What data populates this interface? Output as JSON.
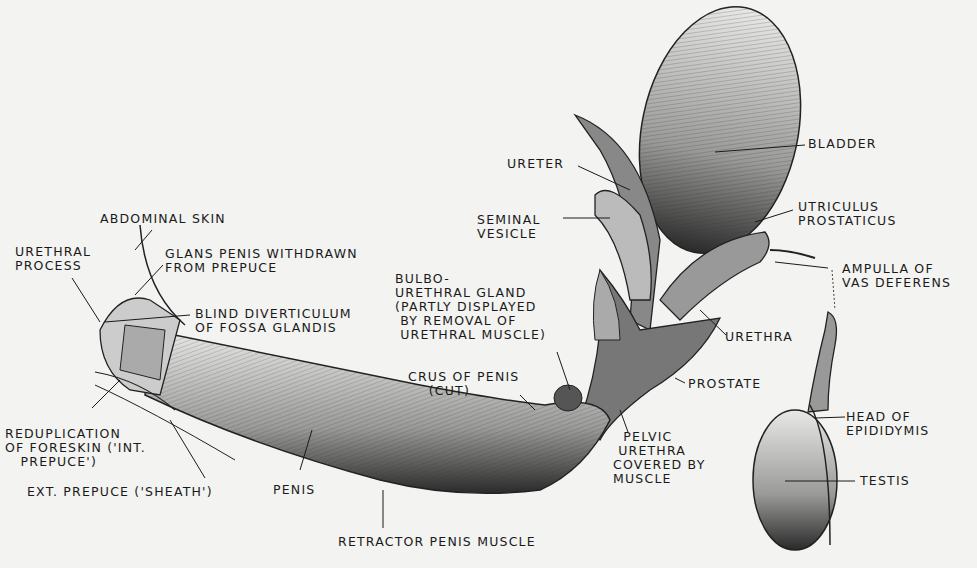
{
  "diagram": {
    "background": "#f3f3f1",
    "ink": "#1a1a1a",
    "labels": [
      {
        "id": "abdominal-skin",
        "text": "ABDOMINAL SKIN"
      },
      {
        "id": "urethral-process",
        "text": "URETHRAL\nPROCESS"
      },
      {
        "id": "glans-penis",
        "text": "GLANS PENIS WITHDRAWN\nFROM PREPUCE"
      },
      {
        "id": "blind-diverticulum",
        "text": "BLIND DIVERTICULUM\nOF FOSSA GLANDIS"
      },
      {
        "id": "reduplication",
        "text": "REDUPLICATION\nOF FORESKIN ('INT.\n   PREPUCE')"
      },
      {
        "id": "ext-prepuce",
        "text": "EXT. PREPUCE ('SHEATH')"
      },
      {
        "id": "penis",
        "text": "PENIS"
      },
      {
        "id": "retractor",
        "text": "RETRACTOR PENIS MUSCLE"
      },
      {
        "id": "bulbo",
        "text": "BULBO-\nURETHRAL GLAND\n(PARTLY DISPLAYED\n BY REMOVAL OF\n URETHRAL MUSCLE)"
      },
      {
        "id": "crus",
        "text": "CRUS OF PENIS\n    (CUT)"
      },
      {
        "id": "pelvic-urethra",
        "text": "  PELVIC\n URETHRA\nCOVERED BY\nMUSCLE"
      },
      {
        "id": "prostate",
        "text": "PROSTATE"
      },
      {
        "id": "urethra",
        "text": "URETHRA"
      },
      {
        "id": "ureter",
        "text": "URETER"
      },
      {
        "id": "seminal-vesicle",
        "text": "SEMINAL\nVESICLE"
      },
      {
        "id": "bladder",
        "text": "BLADDER"
      },
      {
        "id": "utriculus",
        "text": "UTRICULUS\nPROSTATICUS"
      },
      {
        "id": "ampulla",
        "text": "AMPULLA OF\nVAS DEFERENS"
      },
      {
        "id": "head-epididymis",
        "text": "HEAD OF\nEPIDIDYMIS"
      },
      {
        "id": "testis",
        "text": "TESTIS"
      }
    ]
  }
}
